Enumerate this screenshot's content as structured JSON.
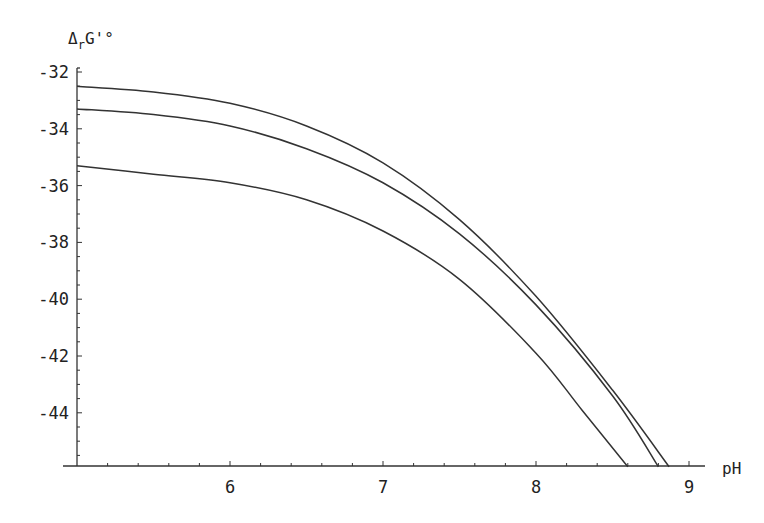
{
  "chart_data": {
    "type": "line",
    "title": "",
    "xlabel": "pH",
    "ylabel": "ΔrG'°",
    "ylabel_main": "Δ",
    "ylabel_sub": "r",
    "ylabel_rest": "G'°",
    "xlim": [
      5.0,
      9.1
    ],
    "ylim": [
      -45.9,
      -32
    ],
    "x_ticks": [
      6,
      7,
      8,
      9
    ],
    "x_tick_labels": [
      "6",
      "7",
      "8",
      "9"
    ],
    "y_ticks": [
      -32,
      -34,
      -36,
      -38,
      -40,
      -42,
      -44
    ],
    "y_tick_labels": [
      "-32",
      "-34",
      "-36",
      "-38",
      "-40",
      "-42",
      "-44"
    ],
    "grid": false,
    "legend": null,
    "series": [
      {
        "name": "curve-top",
        "x": [
          5.0,
          5.5,
          6.0,
          6.5,
          7.0,
          7.5,
          8.0,
          8.5,
          8.87
        ],
        "y": [
          -32.5,
          -32.7,
          -33.1,
          -33.9,
          -35.2,
          -37.2,
          -39.9,
          -43.2,
          -45.9
        ]
      },
      {
        "name": "curve-middle",
        "x": [
          5.0,
          5.5,
          6.0,
          6.5,
          7.0,
          7.5,
          8.0,
          8.5,
          8.8
        ],
        "y": [
          -33.3,
          -33.5,
          -33.9,
          -34.7,
          -35.9,
          -37.7,
          -40.2,
          -43.4,
          -45.9
        ]
      },
      {
        "name": "curve-bottom",
        "x": [
          5.0,
          5.5,
          6.0,
          6.5,
          7.0,
          7.5,
          8.0,
          8.3,
          8.6
        ],
        "y": [
          -35.3,
          -35.6,
          -35.9,
          -36.5,
          -37.6,
          -39.3,
          -41.9,
          -43.9,
          -45.9
        ]
      }
    ]
  },
  "colors": {
    "line": "#333333",
    "axis": "#333333",
    "background": "#ffffff"
  }
}
